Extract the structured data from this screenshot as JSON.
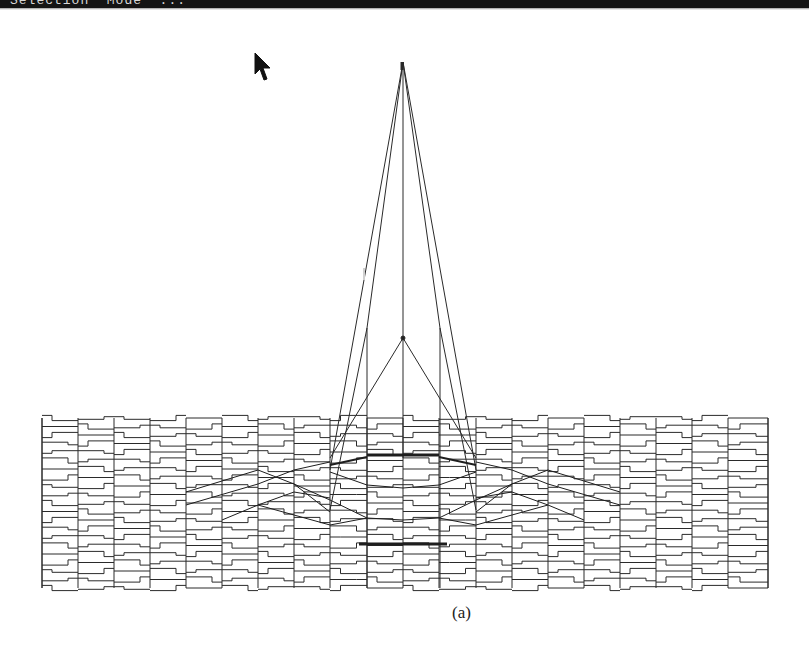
{
  "window": {
    "title_bar_text": "Selection  Mode  ...",
    "title_bar_color": "#141414"
  },
  "viewport": {
    "background": "#ffffff",
    "line_color": "#2a2a2a",
    "cursor_icon": "arrow-pointer-icon"
  },
  "figure": {
    "caption": "(a)",
    "mesh": {
      "left": 42,
      "right": 768,
      "top": 418,
      "bottom": 588,
      "columns_x": [
        42,
        78,
        114,
        150,
        186,
        222,
        258,
        294,
        330,
        367,
        403,
        439,
        476,
        512,
        548,
        584,
        620,
        656,
        692,
        728,
        768
      ],
      "row_count": 21
    },
    "tower": {
      "apex": [
        403,
        62
      ],
      "mid_node": [
        403,
        338
      ],
      "left_post_top": [
        367,
        328
      ],
      "right_post_top": [
        440,
        328
      ]
    }
  }
}
